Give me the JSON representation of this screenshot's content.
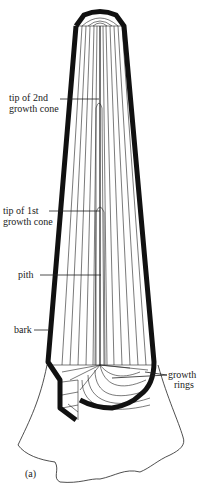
{
  "figure": {
    "panel_label": "(a)",
    "labels": {
      "tip_2nd_line1": "tip of 2nd",
      "tip_2nd_line2": "growth cone",
      "tip_1st_line1": "tip of 1st",
      "tip_1st_line2": "growth cone",
      "pith": "pith",
      "bark": "bark",
      "growth_rings_line1": "growth",
      "growth_rings_line2": "rings"
    },
    "colors": {
      "ink": "#111111",
      "background": "#ffffff"
    }
  }
}
